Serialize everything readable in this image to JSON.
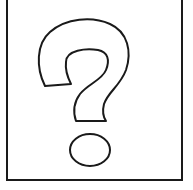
{
  "image": {
    "kind": "placeholder-graphic",
    "symbol": "question-mark",
    "glyph": "?",
    "style": "hand-drawn outline",
    "stroke_color": "#1a1a1a",
    "fill_color": "#ffffff",
    "frame_color": "#1a1a1a"
  }
}
